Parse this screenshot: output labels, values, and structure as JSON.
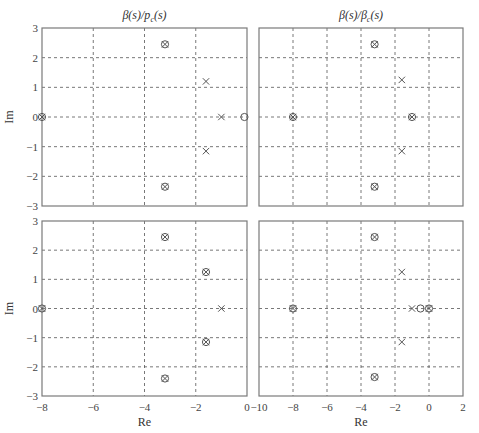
{
  "chart_data": [
    {
      "type": "scatter",
      "panel": "top-left",
      "title": "β(s)/p_c(s)",
      "title_main": "β(s)/p",
      "title_sub": "c",
      "title_tail": "(s)",
      "xlabel": "",
      "ylabel": "Im",
      "xlim": [
        -8,
        0
      ],
      "ylim": [
        -3,
        3
      ],
      "xticks": [
        -8,
        -6,
        -4,
        -2,
        0
      ],
      "yticks": [
        3,
        2,
        1,
        0,
        -1,
        -2,
        -3
      ],
      "grid": true,
      "show_xticklabels": false,
      "show_yticklabels": true,
      "points": [
        {
          "re": -3.2,
          "im": 2.45,
          "marker": "pole-zero"
        },
        {
          "re": -3.2,
          "im": -2.35,
          "marker": "pole-zero"
        },
        {
          "re": -1.6,
          "im": 1.2,
          "marker": "pole"
        },
        {
          "re": -1.6,
          "im": -1.15,
          "marker": "pole"
        },
        {
          "re": -1.0,
          "im": 0,
          "marker": "pole"
        },
        {
          "re": -0.1,
          "im": 0,
          "marker": "zero"
        },
        {
          "re": -8.0,
          "im": 0,
          "marker": "pole-zero"
        }
      ]
    },
    {
      "type": "scatter",
      "panel": "top-right",
      "title": "β(s)/β_c(s)",
      "title_main": "β(s)/β",
      "title_sub": "c",
      "title_tail": "(s)",
      "xlabel": "",
      "ylabel": "",
      "xlim": [
        -10,
        2
      ],
      "ylim": [
        -3,
        3
      ],
      "xticks": [
        -10,
        -8,
        -6,
        -4,
        -2,
        0,
        2
      ],
      "yticks": [
        3,
        2,
        1,
        0,
        -1,
        -2,
        -3
      ],
      "grid": true,
      "show_xticklabels": false,
      "show_yticklabels": false,
      "points": [
        {
          "re": -3.2,
          "im": 2.45,
          "marker": "pole-zero"
        },
        {
          "re": -3.2,
          "im": -2.35,
          "marker": "pole-zero"
        },
        {
          "re": -1.6,
          "im": 1.25,
          "marker": "pole"
        },
        {
          "re": -1.6,
          "im": -1.15,
          "marker": "pole"
        },
        {
          "re": -1.0,
          "im": 0,
          "marker": "pole-zero"
        },
        {
          "re": -8.0,
          "im": 0,
          "marker": "pole-zero"
        }
      ]
    },
    {
      "type": "scatter",
      "panel": "bottom-left",
      "title": "",
      "xlabel": "Re",
      "ylabel": "Im",
      "xlim": [
        -8,
        0
      ],
      "ylim": [
        -3,
        3
      ],
      "xticks": [
        -8,
        -6,
        -4,
        -2,
        0
      ],
      "yticks": [
        3,
        2,
        1,
        0,
        -1,
        -2,
        -3
      ],
      "grid": true,
      "show_xticklabels": true,
      "show_yticklabels": true,
      "points": [
        {
          "re": -3.2,
          "im": 2.45,
          "marker": "pole-zero"
        },
        {
          "re": -3.2,
          "im": -2.4,
          "marker": "pole-zero"
        },
        {
          "re": -1.6,
          "im": 1.25,
          "marker": "pole-zero"
        },
        {
          "re": -1.6,
          "im": -1.15,
          "marker": "pole-zero"
        },
        {
          "re": -1.0,
          "im": 0,
          "marker": "pole"
        },
        {
          "re": -8.0,
          "im": 0,
          "marker": "pole-zero"
        }
      ]
    },
    {
      "type": "scatter",
      "panel": "bottom-right",
      "title": "",
      "xlabel": "Re",
      "ylabel": "",
      "xlim": [
        -10,
        2
      ],
      "ylim": [
        -3,
        3
      ],
      "xticks": [
        -10,
        -8,
        -6,
        -4,
        -2,
        0,
        2
      ],
      "yticks": [
        3,
        2,
        1,
        0,
        -1,
        -2,
        -3
      ],
      "grid": true,
      "show_xticklabels": true,
      "show_yticklabels": false,
      "points": [
        {
          "re": -3.2,
          "im": 2.45,
          "marker": "pole-zero"
        },
        {
          "re": -3.2,
          "im": -2.35,
          "marker": "pole-zero"
        },
        {
          "re": -1.6,
          "im": 1.25,
          "marker": "pole"
        },
        {
          "re": -1.6,
          "im": -1.15,
          "marker": "pole"
        },
        {
          "re": -1.0,
          "im": 0,
          "marker": "pole"
        },
        {
          "re": -0.5,
          "im": 0,
          "marker": "zero"
        },
        {
          "re": 0.0,
          "im": 0,
          "marker": "pole-zero"
        },
        {
          "re": -8.0,
          "im": 0,
          "marker": "pole-zero"
        }
      ]
    }
  ],
  "layout": {
    "panels": [
      {
        "x0": 42,
        "x1": 247,
        "y0": 28,
        "y1": 206
      },
      {
        "x0": 259,
        "x1": 463,
        "y0": 28,
        "y1": 206
      },
      {
        "x0": 42,
        "x1": 247,
        "y0": 221,
        "y1": 396
      },
      {
        "x0": 259,
        "x1": 463,
        "y0": 221,
        "y1": 396
      }
    ]
  },
  "legend": {
    "pole_marker": "×",
    "zero_marker": "○",
    "pole_zero_marker": "⊗"
  }
}
